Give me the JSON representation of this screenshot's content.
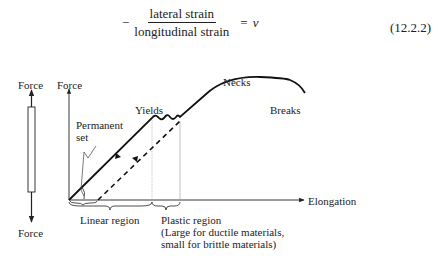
{
  "equation": {
    "sign": "−",
    "numerator": "lateral strain",
    "denominator": "longitudinal strain",
    "equals": "=",
    "rhs": "ν",
    "number": "(12.2.2)"
  },
  "bar_diagram": {
    "top_label": "Force",
    "bottom_label": "Force"
  },
  "graph": {
    "y_axis_label": "Force",
    "x_axis_label": "Elongation",
    "annotations": {
      "yields": "Yields",
      "necks": "Necks",
      "breaks": "Breaks",
      "permanent_set_line1": "Permanent",
      "permanent_set_line2": "set"
    },
    "regions": {
      "linear": "Linear region",
      "plastic_line1": "Plastic region",
      "plastic_line2": "(Large for ductile materials,",
      "plastic_line3": "small for brittle materials)"
    }
  }
}
